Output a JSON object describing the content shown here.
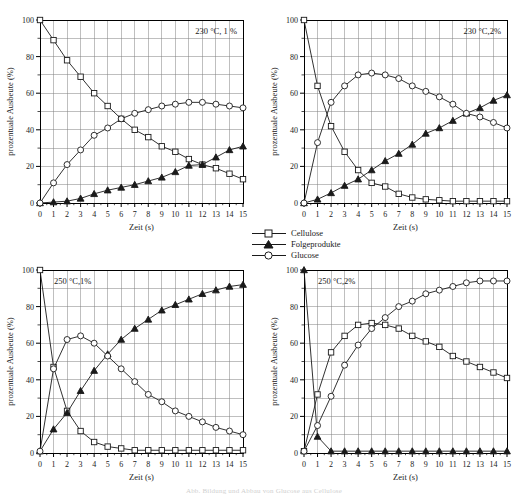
{
  "figure": {
    "caption": "Abb. Bildung und Abbau von Glucose aus Cellulose",
    "y_axis_label": "prozentuale Ausbeute (%)",
    "x_axis_label": "Zeit (s)",
    "y_ticks": [
      0,
      20,
      40,
      60,
      80,
      100
    ],
    "x_ticks": [
      0,
      1,
      2,
      3,
      4,
      5,
      6,
      7,
      8,
      9,
      10,
      11,
      12,
      13,
      14,
      15
    ],
    "colors": {
      "line": "#1a1a1a",
      "grid": "#808080",
      "axis": "#000000",
      "marker_fill": "#ffffff"
    }
  },
  "legend": {
    "position": "center",
    "entries": [
      {
        "label": "Cellulose",
        "marker": "square-open",
        "icon": "square-marker-icon"
      },
      {
        "label": "Folgeprodukte",
        "marker": "triangle-filled",
        "icon": "triangle-marker-icon"
      },
      {
        "label": "Glucose",
        "marker": "circle-open",
        "icon": "circle-marker-icon"
      }
    ]
  },
  "chart_data": [
    {
      "id": "panel-top-left",
      "type": "line",
      "title": "230 °C, 1 %",
      "annotation": "230 °C, 1 %",
      "xlabel": "Zeit (s)",
      "ylabel": "prozentuale Ausbeute (%)",
      "xlim": [
        0,
        15
      ],
      "ylim": [
        0,
        100
      ],
      "grid": true,
      "x": [
        0,
        1,
        2,
        3,
        4,
        5,
        6,
        7,
        8,
        9,
        10,
        11,
        12,
        13,
        14,
        15
      ],
      "series": [
        {
          "name": "Cellulose",
          "marker": "square-open",
          "values": [
            100,
            89,
            78,
            69,
            60,
            53,
            46,
            40,
            36,
            31,
            28,
            24,
            21,
            19,
            16,
            13
          ]
        },
        {
          "name": "Folgeprodukte",
          "marker": "triangle-filled",
          "values": [
            0,
            0.5,
            1,
            2.5,
            5,
            7,
            8.5,
            10,
            12,
            14,
            17,
            20.5,
            21,
            25,
            29,
            31
          ]
        },
        {
          "name": "Glucose",
          "marker": "circle-open",
          "values": [
            0,
            11,
            21,
            29,
            37,
            41,
            46,
            49,
            51,
            53,
            54,
            55,
            55,
            54,
            53,
            52
          ]
        }
      ]
    },
    {
      "id": "panel-top-right",
      "type": "line",
      "title": "230 °C, 2%",
      "annotation": "230 °C,2%",
      "xlabel": "Zeit (s)",
      "ylabel": "prozentuale Ausbeute (%)",
      "xlim": [
        0,
        15
      ],
      "ylim": [
        0,
        100
      ],
      "grid": true,
      "x": [
        0,
        1,
        2,
        3,
        4,
        5,
        6,
        7,
        8,
        9,
        10,
        11,
        12,
        13,
        14,
        15
      ],
      "series": [
        {
          "name": "Cellulose",
          "marker": "square-open",
          "values": [
            100,
            64,
            42,
            28,
            18,
            11,
            9,
            5,
            3,
            2,
            1.5,
            1,
            1,
            1,
            1,
            1
          ]
        },
        {
          "name": "Folgeprodukte",
          "marker": "triangle-filled",
          "values": [
            0,
            2,
            5.5,
            9.5,
            13,
            18,
            23,
            27,
            32,
            38,
            41,
            45,
            49,
            52,
            56,
            59
          ]
        },
        {
          "name": "Glucose",
          "marker": "circle-open",
          "values": [
            0,
            33,
            55,
            64,
            70,
            71,
            70,
            68,
            64,
            61,
            58,
            54,
            49,
            47,
            44,
            41
          ]
        }
      ]
    },
    {
      "id": "panel-bottom-left",
      "type": "line",
      "title": "250 °C, 1%",
      "annotation": "250 °C,1%",
      "xlabel": "Zeit (s)",
      "ylabel": "prozentuale Ausbeute (%)",
      "xlim": [
        0,
        15
      ],
      "ylim": [
        0,
        100
      ],
      "grid": true,
      "x": [
        0,
        1,
        2,
        3,
        4,
        5,
        6,
        7,
        8,
        9,
        10,
        11,
        12,
        13,
        14,
        15
      ],
      "series": [
        {
          "name": "Cellulose",
          "marker": "square-open",
          "values": [
            100,
            47,
            23,
            12,
            6,
            3.5,
            2.5,
            1.5,
            1.5,
            1.5,
            1.5,
            1.5,
            1.5,
            1.5,
            1.5,
            1.5
          ]
        },
        {
          "name": "Folgeprodukte",
          "marker": "triangle-filled",
          "values": [
            1,
            13,
            22,
            34,
            45,
            54,
            62,
            68,
            73,
            78,
            81,
            84,
            87,
            89,
            91,
            92
          ]
        },
        {
          "name": "Glucose",
          "marker": "circle-open",
          "values": [
            1,
            46,
            62,
            64,
            60,
            53,
            46,
            39,
            32,
            28,
            23,
            20,
            17,
            14,
            12,
            10
          ]
        }
      ]
    },
    {
      "id": "panel-bottom-right",
      "type": "line",
      "title": "250 °C, 2%",
      "annotation": "250 °C,2%",
      "xlabel": "Zeit (s)",
      "ylabel": "prozentuale Ausbeute (%)",
      "xlim": [
        0,
        15
      ],
      "ylim": [
        0,
        100
      ],
      "grid": true,
      "x": [
        0,
        1,
        2,
        3,
        4,
        5,
        6,
        7,
        8,
        9,
        10,
        11,
        12,
        13,
        14,
        15
      ],
      "series": [
        {
          "name": "Cellulose",
          "marker": "square-open",
          "values": [
            1,
            32,
            55,
            64,
            70,
            71,
            70,
            68,
            64,
            61,
            58,
            53,
            50,
            47,
            44,
            41
          ]
        },
        {
          "name": "Folgeprodukte",
          "marker": "triangle-filled",
          "values": [
            100,
            9,
            1,
            1,
            1,
            1,
            1,
            1,
            1,
            1,
            1,
            1,
            1,
            1,
            1,
            1
          ]
        },
        {
          "name": "Glucose",
          "marker": "circle-open",
          "values": [
            1,
            15,
            31,
            48,
            59,
            68,
            74,
            80,
            83,
            87,
            89,
            91,
            93,
            94,
            94,
            94
          ]
        }
      ]
    }
  ]
}
